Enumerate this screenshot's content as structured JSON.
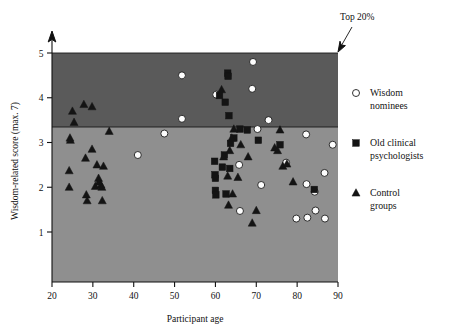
{
  "chart_data": {
    "type": "scatter",
    "title": "",
    "xlabel": "Participant age",
    "ylabel": "Wisdom-related score (max. 7)",
    "xlim": [
      20,
      90
    ],
    "ylim": [
      0.25,
      5.55
    ],
    "xticks": [
      20,
      30,
      40,
      50,
      60,
      70,
      80,
      90
    ],
    "yticks": [
      1,
      2,
      3,
      4,
      5
    ],
    "grid": false,
    "legend_position": "right",
    "annotations": [
      {
        "text": "Top 20%",
        "points_to": "top-right corner of shaded top-20% band",
        "x": 89,
        "y": 5.0
      }
    ],
    "bands": [
      {
        "name": "top-20-percent-band",
        "y_range": [
          3.36,
          5.0
        ],
        "color": "#5a5a5a",
        "label": "Top 20%"
      },
      {
        "name": "lower-band",
        "y_range": [
          0.25,
          3.36
        ],
        "color": "#8f8f8f",
        "label": ""
      }
    ],
    "series": [
      {
        "name": "Wisdom nominees",
        "marker": "open-circle",
        "color": "#ffffff",
        "edge_color": "#1c1c1c",
        "points": [
          [
            41.0,
            2.72
          ],
          [
            47.5,
            3.2
          ],
          [
            51.8,
            4.5
          ],
          [
            51.8,
            3.53
          ],
          [
            60.2,
            4.07
          ],
          [
            65.8,
            2.5
          ],
          [
            66.0,
            1.47
          ],
          [
            69.2,
            4.8
          ],
          [
            69.0,
            4.2
          ],
          [
            70.3,
            3.3
          ],
          [
            71.2,
            2.05
          ],
          [
            73.0,
            3.5
          ],
          [
            77.3,
            2.55
          ],
          [
            79.8,
            1.3
          ],
          [
            82.2,
            3.18
          ],
          [
            82.3,
            2.07
          ],
          [
            82.5,
            1.32
          ],
          [
            84.3,
            1.9
          ],
          [
            84.5,
            1.48
          ],
          [
            86.7,
            2.32
          ],
          [
            86.8,
            1.3
          ],
          [
            88.7,
            2.95
          ]
        ]
      },
      {
        "name": "Old clinical psychologists",
        "marker": "filled-square",
        "color": "#141414",
        "points": [
          [
            59.8,
            2.58
          ],
          [
            59.9,
            2.28
          ],
          [
            60.0,
            2.2
          ],
          [
            60.0,
            1.93
          ],
          [
            60.1,
            1.83
          ],
          [
            61.7,
            2.45
          ],
          [
            62.2,
            2.72
          ],
          [
            62.4,
            3.9
          ],
          [
            62.6,
            1.85
          ],
          [
            63.0,
            4.55
          ],
          [
            63.1,
            4.48
          ],
          [
            63.3,
            3.6
          ],
          [
            63.5,
            2.42
          ],
          [
            63.7,
            2.98
          ],
          [
            61.0,
            4.05
          ],
          [
            64.5,
            3.1
          ],
          [
            66.0,
            3.3
          ],
          [
            67.8,
            3.28
          ],
          [
            70.5,
            3.05
          ],
          [
            75.8,
            2.95
          ],
          [
            84.2,
            1.95
          ]
        ]
      },
      {
        "name": "Control groups",
        "marker": "filled-triangle",
        "color": "#141414",
        "points": [
          [
            24.4,
            3.1
          ],
          [
            24.5,
            3.05
          ],
          [
            25.0,
            3.7
          ],
          [
            25.4,
            3.45
          ],
          [
            24.2,
            2.37
          ],
          [
            24.2,
            2.0
          ],
          [
            27.8,
            3.85
          ],
          [
            28.2,
            2.65
          ],
          [
            28.4,
            1.83
          ],
          [
            28.6,
            1.7
          ],
          [
            29.8,
            3.8
          ],
          [
            29.8,
            2.85
          ],
          [
            30.6,
            2.02
          ],
          [
            31.0,
            2.5
          ],
          [
            31.4,
            2.2
          ],
          [
            31.5,
            2.12
          ],
          [
            32.0,
            2.05
          ],
          [
            32.2,
            2.0
          ],
          [
            32.3,
            1.7
          ],
          [
            32.6,
            2.47
          ],
          [
            34.0,
            3.25
          ],
          [
            61.5,
            4.18
          ],
          [
            62.0,
            2.68
          ],
          [
            63.0,
            2.25
          ],
          [
            63.2,
            1.6
          ],
          [
            63.5,
            2.82
          ],
          [
            64.0,
            3.1
          ],
          [
            64.2,
            1.85
          ],
          [
            64.5,
            3.3
          ],
          [
            65.5,
            2.22
          ],
          [
            66.2,
            2.95
          ],
          [
            68.0,
            2.68
          ],
          [
            70.0,
            1.48
          ],
          [
            69.0,
            1.2
          ],
          [
            74.5,
            2.88
          ],
          [
            75.2,
            2.82
          ],
          [
            75.8,
            3.28
          ],
          [
            76.5,
            2.47
          ],
          [
            77.5,
            2.52
          ],
          [
            79.0,
            2.12
          ]
        ]
      }
    ]
  },
  "legend": {
    "items": [
      {
        "label_line1": "Wisdom",
        "label_line2": "nominees",
        "marker": "open-circle"
      },
      {
        "label_line1": "Old clinical",
        "label_line2": "psychologists",
        "marker": "filled-square"
      },
      {
        "label_line1": "Control",
        "label_line2": "groups",
        "marker": "filled-triangle"
      }
    ]
  },
  "axes": {
    "x_title": "Participant age",
    "y_title": "Wisdom-related score (max. 7)",
    "x_tick_labels": [
      "20",
      "30",
      "40",
      "50",
      "60",
      "70",
      "80",
      "90"
    ],
    "y_tick_labels": [
      "1",
      "2",
      "3",
      "4",
      "5"
    ]
  },
  "annotation": {
    "top20_label": "Top 20%"
  }
}
